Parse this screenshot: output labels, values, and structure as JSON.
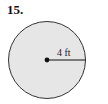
{
  "problem": {
    "number": "15."
  },
  "diagram": {
    "shape": "circle",
    "radius_label": "4 ft",
    "colors": {
      "fill": "#e6e6e6",
      "stroke": "#333333",
      "line": "#111111"
    }
  }
}
